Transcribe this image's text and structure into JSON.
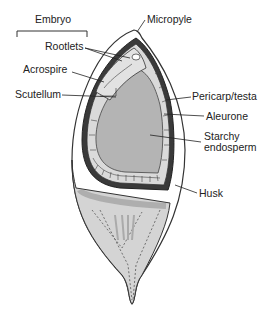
{
  "diagram": {
    "group_labels": {
      "embryo": "Embryo"
    },
    "labels": {
      "rootlets": "Rootlets",
      "acrospire": "Acrospire",
      "scutellum": "Scutellum",
      "micropyle": "Micropyle",
      "pericarp_testa": "Pericarp/testa",
      "aleurone": "Aleurone",
      "starchy_endosperm": "Starchy\nendosperm",
      "husk": "Husk"
    },
    "colors": {
      "husk": "#ffffff",
      "husk_outline": "#333333",
      "pericarp": "#3a3a3a",
      "aleurone": "#d8d8d8",
      "endosperm": "#b4b4b4",
      "base": "#c8c8c8",
      "text": "#222222"
    }
  }
}
